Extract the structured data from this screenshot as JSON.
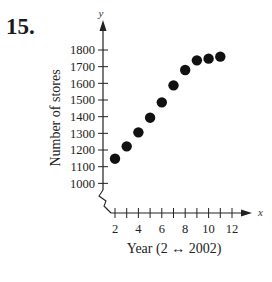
{
  "problem_number": "15.",
  "chart_data": {
    "type": "scatter",
    "title": "",
    "xlabel": "Year (2 ↔ 2002)",
    "ylabel": "Number of stores",
    "x_axis_var": "x",
    "y_axis_var": "y",
    "x_ticks": [
      2,
      4,
      6,
      8,
      10,
      12
    ],
    "y_ticks": [
      1000,
      1100,
      1200,
      1300,
      1400,
      1500,
      1600,
      1700,
      1800
    ],
    "xlim": [
      1.5,
      13
    ],
    "ylim": [
      1000,
      1850
    ],
    "axis_break": "y-axis break between 0 and 1000",
    "grid": false,
    "legend": null,
    "x": [
      2,
      3,
      4,
      5,
      6,
      7,
      8,
      9,
      10,
      11
    ],
    "values": [
      1148,
      1222,
      1306,
      1394,
      1486,
      1588,
      1680,
      1738,
      1748,
      1760
    ]
  },
  "labels": {
    "xlabel": "Year (2 ↔ 2002)",
    "ylabel": "Number of stores",
    "x_var": "x",
    "y_var": "y"
  }
}
